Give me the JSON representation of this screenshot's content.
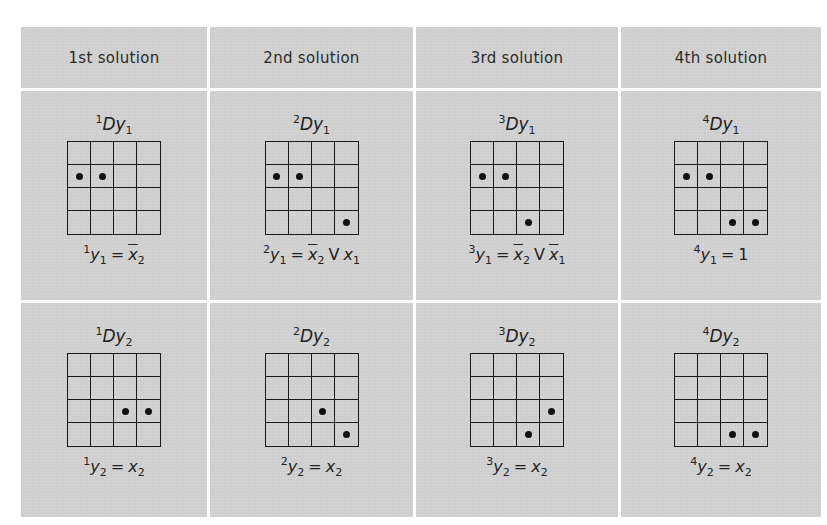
{
  "headers": [
    "1st solution",
    "2nd solution",
    "3rd solution",
    "4th solution"
  ],
  "rows": [
    {
      "output": "y1",
      "cells": [
        {
          "pre": "1",
          "title_main": "Dy",
          "title_sub": "1",
          "dots": [
            [
              1,
              0
            ],
            [
              1,
              1
            ]
          ],
          "eq": [
            {
              "t": "sup",
              "v": "1"
            },
            {
              "t": "var",
              "v": "y"
            },
            {
              "t": "sub",
              "v": "1"
            },
            {
              "t": "op",
              "v": "="
            },
            {
              "t": "ovar",
              "v": "x"
            },
            {
              "t": "sub",
              "v": "2"
            }
          ],
          "equation_text": "¹y₁ = x̄₂"
        },
        {
          "pre": "2",
          "title_main": "Dy",
          "title_sub": "1",
          "dots": [
            [
              1,
              0
            ],
            [
              1,
              1
            ],
            [
              3,
              3
            ]
          ],
          "eq": [
            {
              "t": "sup",
              "v": "2"
            },
            {
              "t": "var",
              "v": "y"
            },
            {
              "t": "sub",
              "v": "1"
            },
            {
              "t": "op",
              "v": "="
            },
            {
              "t": "ovar",
              "v": "x"
            },
            {
              "t": "sub",
              "v": "2"
            },
            {
              "t": "op",
              "v": "V"
            },
            {
              "t": "var",
              "v": "x"
            },
            {
              "t": "sub",
              "v": "1"
            }
          ],
          "equation_text": "²y₁ = x̄₂ V x₁"
        },
        {
          "pre": "3",
          "title_main": "Dy",
          "title_sub": "1",
          "dots": [
            [
              1,
              0
            ],
            [
              1,
              1
            ],
            [
              3,
              2
            ]
          ],
          "eq": [
            {
              "t": "sup",
              "v": "3"
            },
            {
              "t": "var",
              "v": "y"
            },
            {
              "t": "sub",
              "v": "1"
            },
            {
              "t": "op",
              "v": "="
            },
            {
              "t": "ovar",
              "v": "x"
            },
            {
              "t": "sub",
              "v": "2"
            },
            {
              "t": "op",
              "v": "V"
            },
            {
              "t": "ovar",
              "v": "x"
            },
            {
              "t": "sub",
              "v": "1"
            }
          ],
          "equation_text": "³y₁ = x̄₂ V x̄₁"
        },
        {
          "pre": "4",
          "title_main": "Dy",
          "title_sub": "1",
          "dots": [
            [
              1,
              0
            ],
            [
              1,
              1
            ],
            [
              3,
              2
            ],
            [
              3,
              3
            ]
          ],
          "eq": [
            {
              "t": "sup",
              "v": "4"
            },
            {
              "t": "var",
              "v": "y"
            },
            {
              "t": "sub",
              "v": "1"
            },
            {
              "t": "op",
              "v": "="
            },
            {
              "t": "num",
              "v": "1"
            }
          ],
          "equation_text": "⁴y₁ = 1"
        }
      ]
    },
    {
      "output": "y2",
      "cells": [
        {
          "pre": "1",
          "title_main": "Dy",
          "title_sub": "2",
          "dots": [
            [
              2,
              2
            ],
            [
              2,
              3
            ]
          ],
          "eq": [
            {
              "t": "sup",
              "v": "1"
            },
            {
              "t": "var",
              "v": "y"
            },
            {
              "t": "sub",
              "v": "2"
            },
            {
              "t": "op",
              "v": "="
            },
            {
              "t": "var",
              "v": "x"
            },
            {
              "t": "sub",
              "v": "2"
            }
          ],
          "equation_text": "¹y₂ = x₂"
        },
        {
          "pre": "2",
          "title_main": "Dy",
          "title_sub": "2",
          "dots": [
            [
              2,
              2
            ],
            [
              3,
              3
            ]
          ],
          "eq": [
            {
              "t": "sup",
              "v": "2"
            },
            {
              "t": "var",
              "v": "y"
            },
            {
              "t": "sub",
              "v": "2"
            },
            {
              "t": "op",
              "v": "="
            },
            {
              "t": "var",
              "v": "x"
            },
            {
              "t": "sub",
              "v": "2"
            }
          ],
          "equation_text": "²y₂ = x₂"
        },
        {
          "pre": "3",
          "title_main": "Dy",
          "title_sub": "2",
          "dots": [
            [
              2,
              3
            ],
            [
              3,
              2
            ]
          ],
          "eq": [
            {
              "t": "sup",
              "v": "3"
            },
            {
              "t": "var",
              "v": "y"
            },
            {
              "t": "sub",
              "v": "2"
            },
            {
              "t": "op",
              "v": "="
            },
            {
              "t": "var",
              "v": "x"
            },
            {
              "t": "sub",
              "v": "2"
            }
          ],
          "equation_text": "³y₂ = x₂"
        },
        {
          "pre": "4",
          "title_main": "Dy",
          "title_sub": "2",
          "dots": [
            [
              3,
              2
            ],
            [
              3,
              3
            ]
          ],
          "eq": [
            {
              "t": "sup",
              "v": "4"
            },
            {
              "t": "var",
              "v": "y"
            },
            {
              "t": "sub",
              "v": "2"
            },
            {
              "t": "op",
              "v": "="
            },
            {
              "t": "var",
              "v": "x"
            },
            {
              "t": "sub",
              "v": "2"
            }
          ],
          "equation_text": "⁴y₂ = x₂"
        }
      ]
    }
  ],
  "colors": {
    "cell_bg": "#cfcfcf",
    "divider": "#ffffff",
    "ink": "#1a1a1a"
  }
}
